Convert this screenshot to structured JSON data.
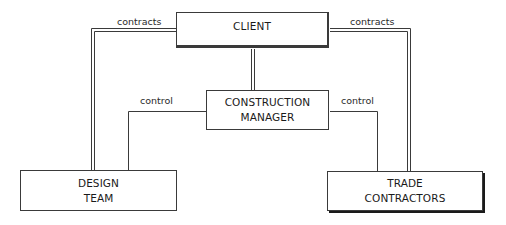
{
  "diagram": {
    "type": "organizational-relationship",
    "nodes": {
      "client": {
        "line1": "CLIENT"
      },
      "construction_manager": {
        "line1": "CONSTRUCTION",
        "line2": "MANAGER"
      },
      "design_team": {
        "line1": "DESIGN",
        "line2": "TEAM"
      },
      "trade_contractors": {
        "line1": "TRADE",
        "line2": "CONTRACTORS"
      }
    },
    "edges": {
      "client_design_team": "contracts",
      "client_trade_contractors": "contracts",
      "cm_design_team": "control",
      "cm_trade_contractors": "control"
    },
    "colors": {
      "line": "#3a3a3a",
      "text": "#1a1a1a",
      "background": "#ffffff"
    }
  }
}
